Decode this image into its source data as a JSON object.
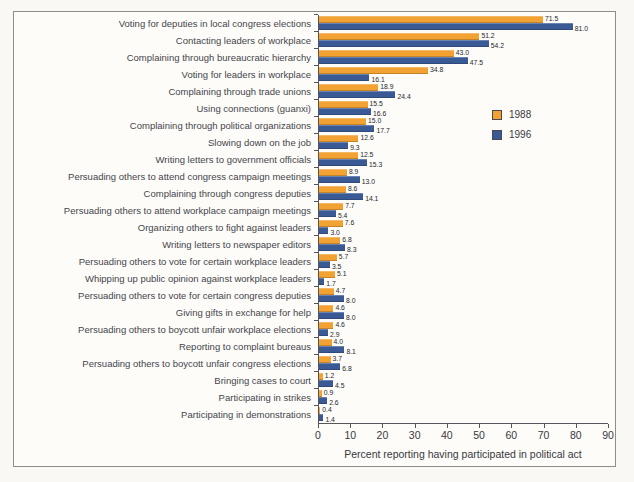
{
  "chart_data": {
    "type": "bar",
    "orientation": "horizontal",
    "title": "",
    "xlabel": "Percent reporting having participated in political act",
    "ylabel": "",
    "xlim": [
      0,
      90
    ],
    "xticks": [
      0,
      10,
      20,
      30,
      40,
      50,
      60,
      70,
      80,
      90
    ],
    "grid": false,
    "legend_position": "inside-upper-right",
    "categories": [
      "Voting for deputies in local congress elections",
      "Contacting leaders of workplace",
      "Complaining through bureaucratic hierarchy",
      "Voting for leaders in workplace",
      "Complaining through trade unions",
      "Using connections (guanxi)",
      "Complaining through political organizations",
      "Slowing down on the job",
      "Writing letters to government officials",
      "Persuading others to attend congress campaign meetings",
      "Complaining through congress deputies",
      "Persuading others to attend workplace campaign meetings",
      "Organizing others to fight against leaders",
      "Writing letters to newspaper editors",
      "Persuading others to vote for certain workplace leaders",
      "Whipping up public opinion against workplace leaders",
      "Persuading others to vote for certain congress deputies",
      "Giving gifts in exchange for help",
      "Persuading others to boycott unfair workplace elections",
      "Reporting to complaint bureaus",
      "Persuading others to boycott unfair congress elections",
      "Bringing cases to court",
      "Participating in strikes",
      "Participating in demonstrations"
    ],
    "series": [
      {
        "name": "1988",
        "color": "#F2A233",
        "values": [
          71.5,
          51.2,
          43.0,
          34.8,
          18.9,
          15.5,
          15.0,
          12.6,
          12.5,
          8.9,
          8.6,
          7.7,
          7.6,
          6.8,
          5.7,
          5.1,
          4.7,
          4.6,
          4.6,
          4.0,
          3.7,
          1.2,
          0.9,
          0.4
        ]
      },
      {
        "name": "1996",
        "color": "#3A5A96",
        "values": [
          81.0,
          54.2,
          47.5,
          16.1,
          24.4,
          16.6,
          17.7,
          9.3,
          15.3,
          13.0,
          14.1,
          5.4,
          3.0,
          8.3,
          3.5,
          1.7,
          8.0,
          8.0,
          2.9,
          8.1,
          6.8,
          4.5,
          2.6,
          1.4
        ]
      }
    ]
  },
  "colors": {
    "paper": "#f9f8f4",
    "figure_background": "#fdfcf8",
    "frame_border": "#8e8e89",
    "axis": "#55555a",
    "label_text": "#45454d"
  }
}
